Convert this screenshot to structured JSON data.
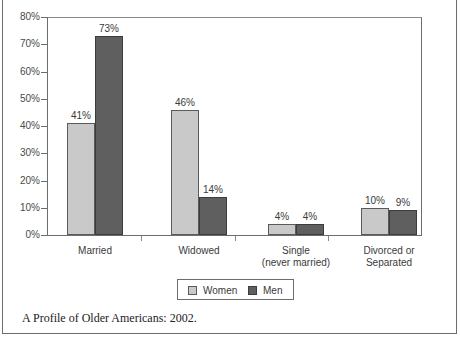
{
  "figure": {
    "caption": "A Profile of Older Americans: 2002."
  },
  "chart_data": {
    "type": "bar",
    "title": "",
    "xlabel": "",
    "ylabel": "",
    "ylim": [
      0,
      80
    ],
    "ytick_labels": [
      "0%",
      "10%",
      "20%",
      "30%",
      "40%",
      "50%",
      "60%",
      "70%",
      "80%"
    ],
    "ytick_values": [
      0,
      10,
      20,
      30,
      40,
      50,
      60,
      70,
      80
    ],
    "grid": false,
    "legend_position": "bottom-center",
    "categories": [
      "Married",
      "Widowed",
      "Single\n(never married)",
      "Divorced or\nSeparated"
    ],
    "category_lines": [
      [
        "Married"
      ],
      [
        "Widowed"
      ],
      [
        "Single",
        "(never married)"
      ],
      [
        "Divorced or",
        "Separated"
      ]
    ],
    "series": [
      {
        "name": "Women",
        "color": "#c9c9c9",
        "values": [
          41,
          46,
          4,
          10
        ],
        "value_labels": [
          "41%",
          "46%",
          "4%",
          "10%"
        ]
      },
      {
        "name": "Men",
        "color": "#5f5f5f",
        "values": [
          73,
          14,
          4,
          9
        ],
        "value_labels": [
          "73%",
          "14%",
          "4%",
          "9%"
        ]
      }
    ]
  },
  "legend": {
    "items": [
      {
        "label": "Women",
        "swatch": "women"
      },
      {
        "label": "Men",
        "swatch": "men"
      }
    ]
  }
}
